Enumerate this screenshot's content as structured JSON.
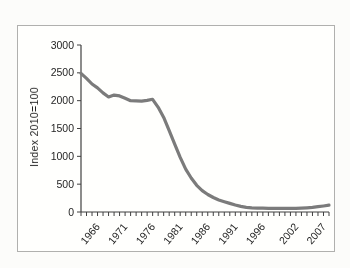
{
  "window": {
    "background_color": "#fcfcfa",
    "panel_background": "#fffffd",
    "panel_border_color": "#b0b0ae"
  },
  "chart_data": {
    "type": "line",
    "title": "",
    "xlabel": "",
    "ylabel": "Index 2010=100",
    "ylim": [
      0,
      3000
    ],
    "y_ticks": [
      0,
      500,
      1000,
      1500,
      2000,
      2500,
      3000
    ],
    "x_range": [
      1963,
      2008
    ],
    "x_labeled_ticks": [
      "1966",
      "1971",
      "1976",
      "1981",
      "1986",
      "1991",
      "1996",
      "2002",
      "2007"
    ],
    "x_labeled_years": [
      1966,
      1971,
      1976,
      1981,
      1986,
      1991,
      1996,
      2002,
      2007
    ],
    "grid": false,
    "legend_position": "none",
    "line_color": "#7b7b7b",
    "line_width": 3.2,
    "axis_color": "#404040",
    "text_color": "#1f1f1f",
    "x": [
      1963,
      1964,
      1965,
      1966,
      1967,
      1968,
      1969,
      1970,
      1971,
      1972,
      1973,
      1974,
      1975,
      1976,
      1977,
      1978,
      1979,
      1980,
      1981,
      1982,
      1983,
      1984,
      1985,
      1986,
      1987,
      1988,
      1989,
      1990,
      1991,
      1992,
      1993,
      1994,
      1995,
      1996,
      1997,
      1998,
      1999,
      2000,
      2001,
      2002,
      2003,
      2004,
      2005,
      2006,
      2007,
      2008
    ],
    "series": [
      {
        "name": "Index (2010=100)",
        "values": [
          2490,
          2400,
          2300,
          2230,
          2140,
          2065,
          2100,
          2085,
          2045,
          2000,
          1995,
          1990,
          2005,
          2025,
          1880,
          1700,
          1460,
          1220,
          980,
          770,
          610,
          480,
          385,
          315,
          260,
          215,
          185,
          155,
          125,
          100,
          85,
          75,
          70,
          68,
          67,
          66,
          66,
          66,
          66,
          67,
          70,
          75,
          82,
          95,
          108,
          122
        ]
      }
    ]
  }
}
